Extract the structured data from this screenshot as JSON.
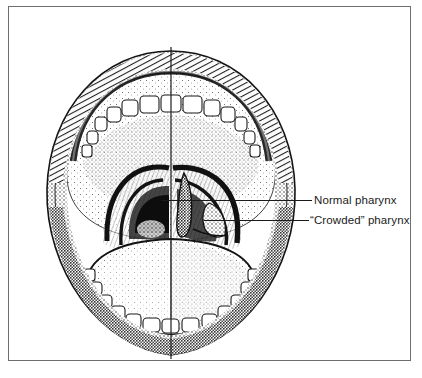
{
  "figure": {
    "type": "medical-illustration",
    "background_color": "#ffffff",
    "ink_color": "#1a1a1a",
    "frame": {
      "visible": true,
      "border_color": "#6f6f6f",
      "border_width_px": 1
    }
  },
  "illustration": {
    "midline": {
      "name": "vertical-midline-divider",
      "orientation": "vertical",
      "description": "Vertical rule splitting the mouth into left (normal) and right (crowded) halves"
    },
    "anatomy": [
      {
        "name": "upper-lip",
        "side": "both"
      },
      {
        "name": "lower-lip",
        "side": "both"
      },
      {
        "name": "upper-teeth-arch",
        "side": "both"
      },
      {
        "name": "lower-teeth-arch",
        "side": "both"
      },
      {
        "name": "hard-palate",
        "side": "both"
      },
      {
        "name": "soft-palate",
        "side": "both"
      },
      {
        "name": "tongue",
        "side": "both"
      },
      {
        "name": "pharyngeal-arch-open",
        "side": "left"
      },
      {
        "name": "pharyngeal-arch-crowded",
        "side": "right"
      },
      {
        "name": "uvula",
        "side": "right"
      },
      {
        "name": "tonsil",
        "side": "right"
      }
    ]
  },
  "callouts": [
    {
      "id": "normal",
      "label": "Normal pharynx",
      "points_to": "left half of illustration",
      "leader_line": true
    },
    {
      "id": "crowded",
      "label": "“Crowded” pharynx",
      "points_to": "right half of illustration",
      "leader_line": true
    }
  ]
}
